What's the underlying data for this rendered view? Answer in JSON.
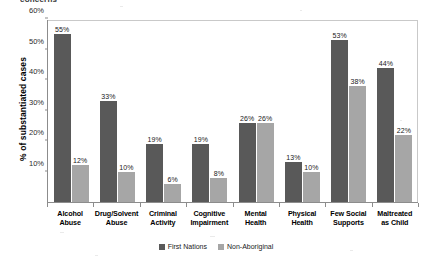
{
  "title_fragment": "concerns",
  "legend": {
    "position": "bottom-center",
    "items": [
      {
        "label": "First Nations",
        "color": "#595959",
        "icon": "legend-swatch"
      },
      {
        "label": "Non-Aboriginal",
        "color": "#a6a6a6",
        "icon": "legend-swatch"
      }
    ]
  },
  "yaxis": {
    "label": "% of substantiated cases",
    "ticks": [
      "10%",
      "20%",
      "30%",
      "40%",
      "50%",
      "60%"
    ]
  },
  "chart_data": {
    "type": "bar",
    "title": "concerns",
    "xlabel": "",
    "ylabel": "% of substantiated cases",
    "ylim": [
      0,
      60
    ],
    "ytick_values": [
      0,
      10,
      20,
      30,
      40,
      50,
      60
    ],
    "ytick_labels": [
      "0%",
      "10%",
      "20%",
      "30%",
      "40%",
      "50%",
      "60%"
    ],
    "grid": false,
    "legend_position": "bottom-center",
    "categories": [
      "Alcohol Abuse",
      "Drug/Solvent Abuse",
      "Criminal Activity",
      "Cognitive Impairment",
      "Mental Health",
      "Physical Health",
      "Few Social Supports",
      "Maltreated as Child"
    ],
    "category_lines": [
      [
        "Alcohol",
        "Abuse"
      ],
      [
        "Drug/Solvent",
        "Abuse"
      ],
      [
        "Criminal",
        "Activity"
      ],
      [
        "Cognitive",
        "Impairment"
      ],
      [
        "Mental",
        "Health"
      ],
      [
        "Physical",
        "Health"
      ],
      [
        "Few Social",
        "Supports"
      ],
      [
        "Maltreated",
        "as Child"
      ]
    ],
    "series": [
      {
        "name": "First Nations",
        "color": "#595959",
        "values": [
          55,
          33,
          19,
          19,
          26,
          13,
          53,
          44
        ],
        "labels": [
          "55%",
          "33%",
          "19%",
          "19%",
          "26%",
          "13%",
          "53%",
          "44%"
        ]
      },
      {
        "name": "Non-Aboriginal",
        "color": "#a6a6a6",
        "values": [
          12,
          10,
          6,
          8,
          26,
          10,
          38,
          22
        ],
        "labels": [
          "12%",
          "10%",
          "6%",
          "8%",
          "26%",
          "10%",
          "38%",
          "22%"
        ]
      }
    ]
  }
}
